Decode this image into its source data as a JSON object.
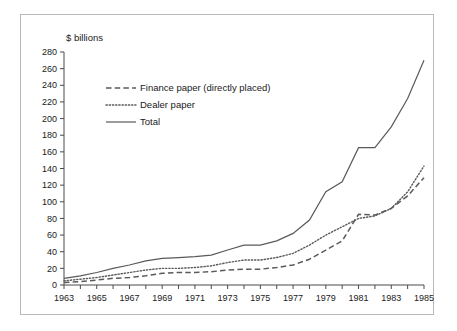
{
  "chart_data": {
    "type": "line",
    "title": "",
    "xlabel": "",
    "ylabel": "$ billions",
    "ylim": [
      0,
      280
    ],
    "ytick_step": 20,
    "yticks": [
      0,
      20,
      40,
      60,
      80,
      100,
      120,
      140,
      160,
      180,
      200,
      220,
      240,
      260,
      280
    ],
    "xlim": [
      1963,
      1985
    ],
    "xticks_labeled": [
      1963,
      1965,
      1967,
      1969,
      1971,
      1973,
      1975,
      1977,
      1979,
      1981,
      1983,
      1985
    ],
    "x": [
      1963,
      1964,
      1965,
      1966,
      1967,
      1968,
      1969,
      1970,
      1971,
      1972,
      1973,
      1974,
      1975,
      1976,
      1977,
      1978,
      1979,
      1980,
      1981,
      1982,
      1983,
      1984,
      1985
    ],
    "grid": false,
    "legend_position": "upper-left-inside",
    "series": [
      {
        "name": "Finance paper (directly placed)",
        "style": "dashed",
        "color": "#5a5a5a",
        "values": [
          3,
          4,
          6,
          8,
          9,
          11,
          14,
          15,
          15,
          16,
          18,
          19,
          19,
          21,
          24,
          31,
          42,
          53,
          85,
          84,
          92,
          107,
          129
        ]
      },
      {
        "name": "Dealer paper",
        "style": "dotted",
        "color": "#5a5a5a",
        "values": [
          5,
          7,
          9,
          12,
          15,
          18,
          20,
          20,
          21,
          23,
          27,
          30,
          30,
          33,
          38,
          48,
          60,
          70,
          80,
          83,
          92,
          112,
          143
        ]
      },
      {
        "name": "Total",
        "style": "solid",
        "color": "#5a5a5a",
        "values": [
          8,
          11,
          15,
          20,
          24,
          29,
          32,
          33,
          34,
          36,
          42,
          48,
          48,
          53,
          62,
          78,
          112,
          124,
          165,
          165,
          190,
          224,
          270
        ]
      }
    ]
  },
  "legend": {
    "items": [
      {
        "label": "Finance paper (directly placed)",
        "style": "dashed"
      },
      {
        "label": "Dealer paper",
        "style": "dotted"
      },
      {
        "label": "Total",
        "style": "solid"
      }
    ]
  },
  "axis": {
    "y_title": "$ billions"
  }
}
